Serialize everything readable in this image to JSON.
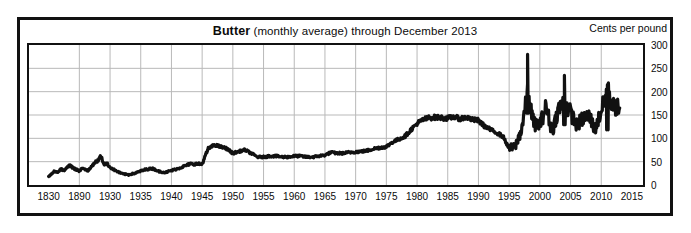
{
  "chart_data": {
    "type": "line",
    "title": "Butter (monthly average) through December 2013",
    "title_strong": "Butter",
    "title_rest": " (monthly average) through December 2013",
    "unit_caption": "Cents per pound",
    "xlabel": "",
    "ylabel": "Cents per pound",
    "ylim": [
      0,
      300
    ],
    "yticks": [
      0,
      50,
      100,
      150,
      200,
      250,
      300
    ],
    "ytick_labels": [
      "0",
      "50",
      "100",
      "150",
      "200",
      "250",
      "300"
    ],
    "grid": true,
    "legend": "none",
    "xtick_labels": [
      "1830",
      "1890",
      "1930",
      "1935",
      "1940",
      "1945",
      "1950",
      "1955",
      "1960",
      "1965",
      "1970",
      "1975",
      "1980",
      "1985",
      "1990",
      "1995",
      "2000",
      "2005",
      "2010",
      "2015"
    ],
    "xtick_positions_px": [
      32,
      82,
      132,
      182,
      232,
      282,
      332,
      382,
      432,
      482,
      532,
      582,
      632,
      682,
      732,
      782,
      832,
      882,
      932,
      982
    ],
    "x_axis_note": "Compressed early axis: 1830 then 1890 then five-year steps from 1930 to 2015",
    "series_name": "Butter price",
    "line_color": "#111111",
    "x": [
      1830,
      1836,
      1842,
      1848,
      1854,
      1860,
      1866,
      1872,
      1878,
      1884,
      1890,
      1894,
      1898,
      1902,
      1906,
      1910,
      1914,
      1918,
      1922,
      1926,
      1930,
      1931,
      1932,
      1933,
      1934,
      1935,
      1936,
      1937,
      1938,
      1939,
      1940,
      1941,
      1942,
      1943,
      1944,
      1945,
      1946,
      1947,
      1948,
      1949,
      1950,
      1951,
      1952,
      1953,
      1954,
      1955,
      1956,
      1957,
      1958,
      1959,
      1960,
      1961,
      1962,
      1963,
      1964,
      1965,
      1966,
      1967,
      1968,
      1969,
      1970,
      1971,
      1972,
      1973,
      1974,
      1975,
      1976,
      1977,
      1978,
      1979,
      1980,
      1981,
      1982,
      1983,
      1984,
      1985,
      1986,
      1987,
      1988,
      1989,
      1990,
      1991,
      1992,
      1993,
      1994,
      1995,
      1996,
      1997,
      1998,
      1999,
      2000,
      2001,
      2002,
      2003,
      2004,
      2005,
      2006,
      2007,
      2008,
      2009,
      2010,
      2011,
      2012,
      2013
    ],
    "values": [
      18,
      24,
      30,
      27,
      34,
      31,
      38,
      42,
      36,
      33,
      30,
      36,
      33,
      31,
      40,
      48,
      52,
      62,
      45,
      46,
      38,
      30,
      24,
      22,
      25,
      30,
      34,
      35,
      29,
      27,
      31,
      35,
      40,
      45,
      45,
      45,
      78,
      86,
      82,
      78,
      68,
      72,
      75,
      68,
      60,
      60,
      62,
      62,
      60,
      60,
      62,
      62,
      60,
      60,
      62,
      64,
      70,
      68,
      68,
      70,
      71,
      72,
      74,
      78,
      80,
      82,
      92,
      98,
      104,
      118,
      132,
      140,
      144,
      145,
      144,
      143,
      146,
      142,
      145,
      140,
      138,
      126,
      118,
      112,
      104,
      78,
      82,
      118,
      196,
      132,
      128,
      168,
      114,
      162,
      178,
      155,
      128,
      142,
      148,
      120,
      158,
      205,
      168,
      165
    ],
    "monthly_note": "Monthly-average series; modern era highly volatile with peak near 280 cents in 1998 and secondary peaks near 240 in 2004 and 220 in 2011",
    "peaks": [
      {
        "year": 1998,
        "value": 280
      },
      {
        "year": 2004,
        "value": 235
      },
      {
        "year": 2011,
        "value": 215
      }
    ]
  }
}
